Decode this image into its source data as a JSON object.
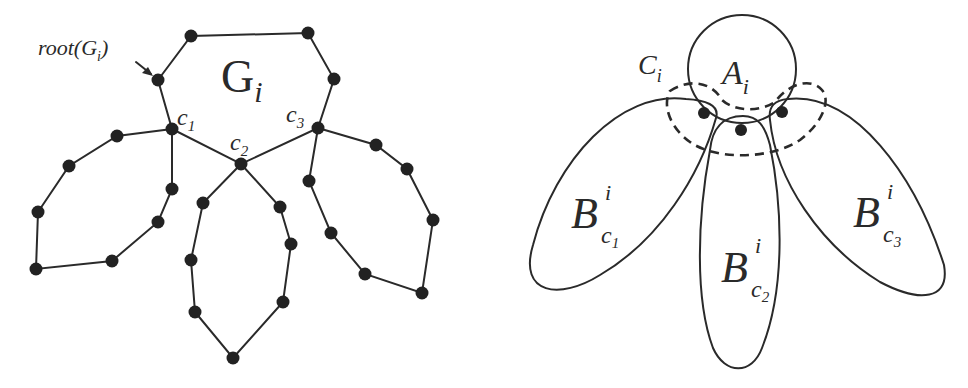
{
  "left_diagram": {
    "title_label": "G",
    "title_sub": "i",
    "root_label": "root(G",
    "root_sub": "i",
    "root_close": ")",
    "cut_vertices": [
      {
        "name": "c",
        "sub": "1"
      },
      {
        "name": "c",
        "sub": "2"
      },
      {
        "name": "c",
        "sub": "3"
      }
    ]
  },
  "right_diagram": {
    "core_label": "A",
    "core_sub": "i",
    "cut_label": "C",
    "cut_sub": "i",
    "blocks": [
      {
        "name": "B",
        "sup": "i",
        "sub": "c",
        "subsub": "1"
      },
      {
        "name": "B",
        "sup": "i",
        "sub": "c",
        "subsub": "2"
      },
      {
        "name": "B",
        "sup": "i",
        "sub": "c",
        "subsub": "3"
      }
    ]
  },
  "colors": {
    "ink": "#2a2a2a",
    "background": "#ffffff"
  }
}
